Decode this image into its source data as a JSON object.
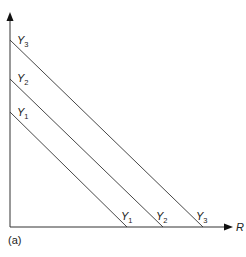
{
  "diagram": {
    "caption": "(a)",
    "x_axis_label": "R",
    "colors": {
      "line": "#333333",
      "text": "#222222",
      "background": "#ffffff"
    },
    "lines": [
      {
        "name": "Y",
        "sub": "1",
        "start": [
          10,
          112
        ],
        "end": [
          127,
          227
        ]
      },
      {
        "name": "Y",
        "sub": "2",
        "start": [
          10,
          79
        ],
        "end": [
          163,
          227
        ]
      },
      {
        "name": "Y",
        "sub": "3",
        "start": [
          10,
          40
        ],
        "end": [
          203,
          227
        ]
      }
    ]
  }
}
